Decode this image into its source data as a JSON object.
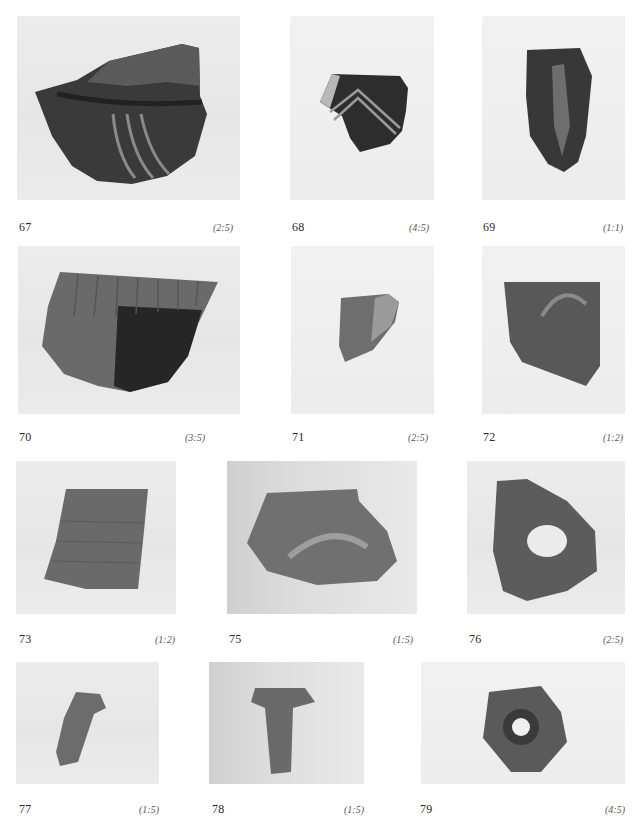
{
  "page": {
    "type": "catalog-plate",
    "background": "#ffffff"
  },
  "figures": [
    {
      "number": "67",
      "scale": "(2:5)",
      "subject": "dark sherd with curved parallel grooves"
    },
    {
      "number": "68",
      "scale": "(4:5)",
      "subject": "dark sherd with light chevron stripes"
    },
    {
      "number": "69",
      "scale": "(1:1)",
      "subject": "elongated dark sherd with vertical ridge"
    },
    {
      "number": "70",
      "scale": "(3:5)",
      "subject": "sherd with ribbed upper zone and dark lower half"
    },
    {
      "number": "71",
      "scale": "(2:5)",
      "subject": "small sherd with raised rib"
    },
    {
      "number": "72",
      "scale": "(1:2)",
      "subject": "sherd with arched relief"
    },
    {
      "number": "73",
      "scale": "(1:2)",
      "subject": "rim sherd with horizontal striations"
    },
    {
      "number": "75",
      "scale": "(1:5)",
      "subject": "rounded sherd with arched relief"
    },
    {
      "number": "76",
      "scale": "(2:5)",
      "subject": "perforated lug with scalloped edge"
    },
    {
      "number": "77",
      "scale": "(1:5)",
      "subject": "bent cylindrical fragment"
    },
    {
      "number": "78",
      "scale": "(1:5)",
      "subject": "T-shaped fragment"
    },
    {
      "number": "79",
      "scale": "(4:5)",
      "subject": "spindle whorl with incised concentric lines"
    }
  ]
}
